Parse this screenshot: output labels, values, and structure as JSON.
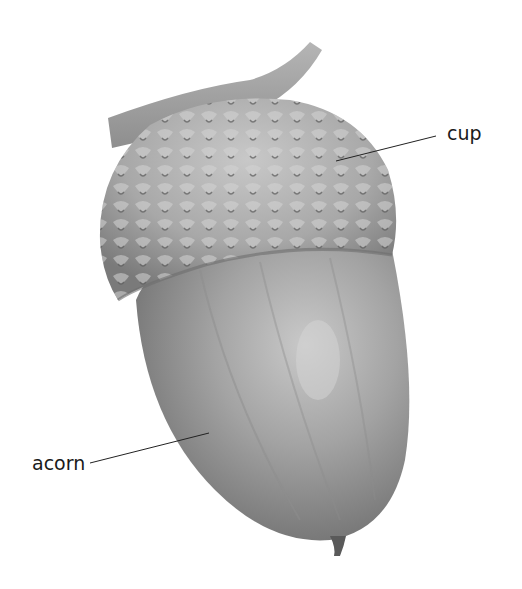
{
  "diagram": {
    "subject": "acorn",
    "labels": [
      {
        "id": "cup",
        "text": "cup"
      },
      {
        "id": "acorn",
        "text": "acorn"
      }
    ],
    "colors": {
      "background": "#ffffff",
      "leader_line": "#222222",
      "label_text": "#1a1a1a"
    }
  }
}
